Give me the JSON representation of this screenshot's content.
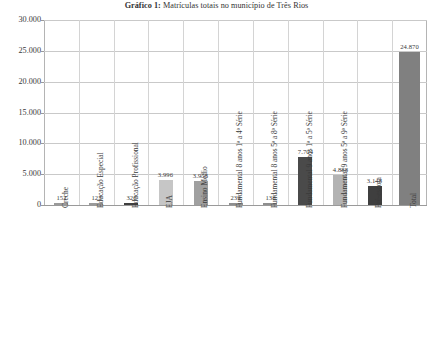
{
  "chart_data": {
    "type": "bar",
    "title_bold": "Gráfico 1:",
    "title_rest": " Matrículas totais no município de Três Rios",
    "title": "Gráfico 1: Matrículas totais no município de Três Rios",
    "xlabel": "",
    "ylabel": "",
    "ylim": [
      0,
      30000
    ],
    "grid": true,
    "legend": "none",
    "ytick_labels": [
      "30.000",
      "25.000",
      "20.000",
      "15.000",
      "10.000",
      "5.000",
      "0"
    ],
    "ytick_values": [
      30000,
      25000,
      20000,
      15000,
      10000,
      5000,
      0
    ],
    "categories": [
      "Creche",
      "Educação Especial",
      "Educação Profissional",
      "EJA",
      "Ensino Médio",
      "Fundamental 8 anos 1ª a 4ª Série",
      "Fundamental 8 anos 5ª a 8ª Série",
      "Fundamental 9 anos 1ª a 5ª Série",
      "Fundamental 9 anos 5ª a 9ª Série",
      "Pré-escola",
      "Total"
    ],
    "values": [
      152,
      123,
      326,
      3996,
      3958,
      239,
      138,
      7704,
      4888,
      3148,
      24870
    ],
    "value_labels": [
      "152",
      "123",
      "326",
      "3.996",
      "3.958",
      "239",
      "138",
      "7.704",
      "4.888",
      "3.148",
      "24.870"
    ],
    "bar_colors": [
      "#9a9a9a",
      "#9a9a9a",
      "#3f3f3f",
      "#c6c6c6",
      "#a0a0a0",
      "#8f8f8f",
      "#8f8f8f",
      "#4a4a4a",
      "#b3b3b3",
      "#3f3f3f",
      "#808080"
    ]
  },
  "colors": {
    "grid": "#c9c9c9",
    "axis": "#9a9a9a",
    "text": "#3a3a3a",
    "background": "#ffffff"
  }
}
